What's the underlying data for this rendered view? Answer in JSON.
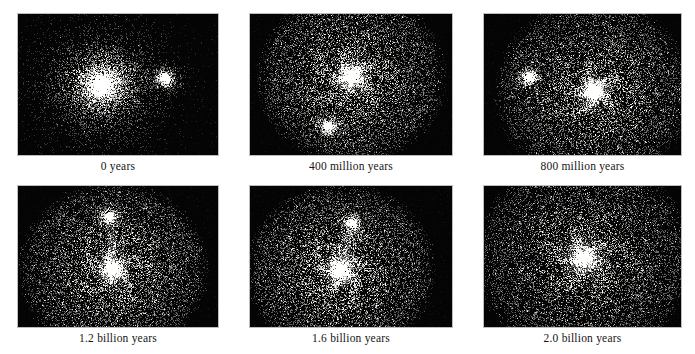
{
  "figure": {
    "background_color": "#ffffff",
    "panel_background_color": "#040404",
    "caption_color": "#151515",
    "star_color": "#ffffff",
    "columns": 3,
    "rows": 2
  },
  "panels": [
    {
      "caption": "0 years",
      "x": 18,
      "y": 14,
      "width": 200,
      "height": 141,
      "caption_y": 160,
      "stage": "pre-merger diffuse proto-galaxy with distinct companion",
      "components": [
        {
          "kind": "diffuse-blob",
          "cx": 0.42,
          "cy": 0.5,
          "radius": 0.4,
          "core_radius": 0.12,
          "brightness": 0.95,
          "points": 6500
        },
        {
          "kind": "companion",
          "cx": 0.735,
          "cy": 0.455,
          "radius": 0.065,
          "brightness": 1.0,
          "points": 900
        }
      ]
    },
    {
      "caption": "400 million years",
      "x": 250,
      "y": 14,
      "width": 202,
      "height": 141,
      "caption_y": 160,
      "stage": "spiral arms forming, companion at lower left",
      "components": [
        {
          "kind": "spiral",
          "cx": 0.5,
          "cy": 0.445,
          "radius": 0.4,
          "core_radius": 0.085,
          "arms": 5,
          "twist": 2.6,
          "brightness": 0.92,
          "points": 7000
        },
        {
          "kind": "companion",
          "cx": 0.385,
          "cy": 0.795,
          "radius": 0.055,
          "brightness": 1.0,
          "points": 800
        }
      ]
    },
    {
      "caption": "800 million years",
      "x": 484,
      "y": 14,
      "width": 197,
      "height": 141,
      "caption_y": 160,
      "stage": "tight spiral, companion to the left",
      "components": [
        {
          "kind": "spiral",
          "cx": 0.555,
          "cy": 0.545,
          "radius": 0.42,
          "core_radius": 0.075,
          "arms": 5,
          "twist": 2.9,
          "brightness": 0.9,
          "points": 7200
        },
        {
          "kind": "companion",
          "cx": 0.225,
          "cy": 0.445,
          "radius": 0.055,
          "brightness": 1.0,
          "points": 800
        }
      ]
    },
    {
      "caption": "1.2 billion years",
      "x": 18,
      "y": 186,
      "width": 200,
      "height": 141,
      "caption_y": 332,
      "stage": "companion above, tidal bridge toward spiral",
      "components": [
        {
          "kind": "spiral",
          "cx": 0.475,
          "cy": 0.585,
          "radius": 0.4,
          "core_radius": 0.075,
          "arms": 5,
          "twist": 3.1,
          "brightness": 0.9,
          "points": 7000
        },
        {
          "kind": "companion",
          "cx": 0.455,
          "cy": 0.215,
          "radius": 0.05,
          "brightness": 1.0,
          "points": 750
        },
        {
          "kind": "bridge",
          "x1": 0.455,
          "y1": 0.255,
          "x2": 0.475,
          "y2": 0.5,
          "brightness": 0.5,
          "points": 320
        }
      ]
    },
    {
      "caption": "1.6 billion years",
      "x": 250,
      "y": 186,
      "width": 202,
      "height": 141,
      "caption_y": 332,
      "stage": "companion descending into disk, arms disturbed",
      "components": [
        {
          "kind": "spiral",
          "cx": 0.445,
          "cy": 0.595,
          "radius": 0.4,
          "core_radius": 0.08,
          "arms": 5,
          "twist": 3.3,
          "brightness": 0.92,
          "points": 7200
        },
        {
          "kind": "companion",
          "cx": 0.505,
          "cy": 0.265,
          "radius": 0.052,
          "brightness": 1.0,
          "points": 800
        },
        {
          "kind": "bridge",
          "x1": 0.495,
          "y1": 0.315,
          "x2": 0.455,
          "y2": 0.52,
          "brightness": 0.6,
          "points": 350
        }
      ]
    },
    {
      "caption": "2.0 billion years",
      "x": 484,
      "y": 186,
      "width": 197,
      "height": 141,
      "caption_y": 332,
      "stage": "merged single spiral with bright core",
      "components": [
        {
          "kind": "spiral",
          "cx": 0.505,
          "cy": 0.505,
          "radius": 0.46,
          "core_radius": 0.105,
          "arms": 5,
          "twist": 2.7,
          "brightness": 0.88,
          "points": 8000
        }
      ]
    }
  ]
}
